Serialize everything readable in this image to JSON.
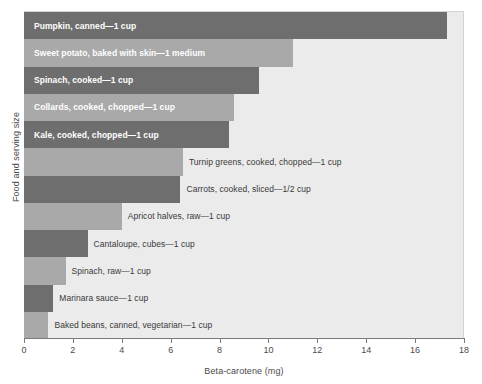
{
  "chart_data": {
    "type": "bar",
    "orientation": "horizontal",
    "title": "",
    "xlabel": "Beta-carotene (mg)",
    "ylabel": "Food and serving size",
    "xlim": [
      0,
      18
    ],
    "xticks": [
      0,
      2,
      4,
      6,
      8,
      10,
      12,
      14,
      16,
      18
    ],
    "xtick_labels": [
      "0",
      "2",
      "4",
      "6",
      "8",
      "10",
      "12",
      "14",
      "16",
      "18"
    ],
    "grid": false,
    "legend": "none",
    "categories": [
      "Pumpkin, canned—1 cup",
      "Sweet potato, baked with skin—1 medium",
      "Spinach, cooked—1 cup",
      "Collards, cooked, chopped—1 cup",
      "Kale, cooked, chopped—1 cup",
      "Turnip greens, cooked, chopped—1 cup",
      "Carrots, cooked, sliced—1/2 cup",
      "Apricot halves, raw—1 cup",
      "Cantaloupe, cubes—1 cup",
      "Spinach, raw—1 cup",
      "Marinara sauce—1 cup",
      "Baked beans, canned, vegetarian—1 cup"
    ],
    "values": [
      17.3,
      11.0,
      9.6,
      8.6,
      8.4,
      6.5,
      6.4,
      4.0,
      2.6,
      1.7,
      1.2,
      1.0
    ],
    "bar_colors": [
      "#6e6e6e",
      "#a9a9a9",
      "#6e6e6e",
      "#a9a9a9",
      "#6e6e6e",
      "#a9a9a9",
      "#6e6e6e",
      "#a9a9a9",
      "#6e6e6e",
      "#a9a9a9",
      "#6e6e6e",
      "#a9a9a9"
    ],
    "label_placement": [
      "inside",
      "inside",
      "inside",
      "inside",
      "inside",
      "outside",
      "outside",
      "outside",
      "outside",
      "outside",
      "outside",
      "outside"
    ],
    "plot_background": "#ebebeb",
    "axis_color": "#7a7a7a"
  }
}
